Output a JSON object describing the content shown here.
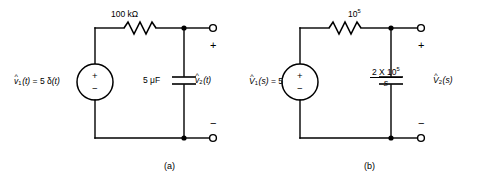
{
  "figure": {
    "kind": "circuit-diagram-pair",
    "background_color": "#ffffff",
    "line_color": "#000000"
  },
  "panels": [
    {
      "id": "a",
      "caption": "(a)",
      "source": {
        "label_prefix": "v",
        "label_hat": "^",
        "label_sub": "1",
        "label_arg": "(t)",
        "label_equals": "= 5 ",
        "label_value": "δ(t)",
        "label_full": "v̂1(t) = 5 δ(t)",
        "plus_sign": "+",
        "minus_sign": "−"
      },
      "resistor": {
        "label": "100 kΩ",
        "value": "100",
        "unit": "kΩ"
      },
      "capacitor": {
        "label": "5 μF",
        "value": "5",
        "unit": "μF"
      },
      "output": {
        "label_prefix": "v",
        "label_hat": "^",
        "label_sub": "2",
        "label_arg": "(t)",
        "label_full": "v̂2(t)",
        "plus_sign": "+",
        "minus_sign": "−"
      }
    },
    {
      "id": "b",
      "caption": "(b)",
      "source": {
        "label_prefix": "V",
        "label_hat": "^",
        "label_sub": "1",
        "label_arg": "(s)",
        "label_equals": "= 5",
        "label_value": "5",
        "label_full": "V̂1(s) = 5",
        "plus_sign": "+",
        "minus_sign": "−"
      },
      "resistor": {
        "label": "10⁵",
        "mantissa": "10",
        "exponent": "5"
      },
      "capacitor": {
        "numerator_lead": "2 X 10",
        "numerator_exponent": "5",
        "denominator": "s",
        "label_full": "2 X 10⁵ / s"
      },
      "output": {
        "label_prefix": "V",
        "label_hat": "^",
        "label_sub": "2",
        "label_arg": "(s)",
        "label_full": "V̂2(s)",
        "plus_sign": "+",
        "minus_sign": "−"
      }
    }
  ]
}
